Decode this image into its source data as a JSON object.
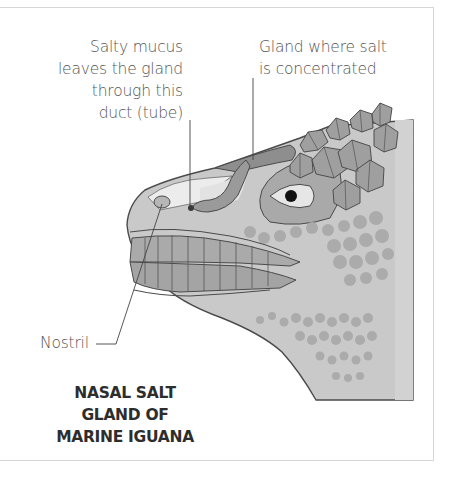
{
  "diagram": {
    "title_lines": [
      "NASAL SALT",
      "GLAND OF",
      "MARINE IGUANA"
    ],
    "labels": {
      "duct": {
        "lines": [
          "Salty mucus",
          "leaves the gland",
          "through this",
          "duct (tube)"
        ]
      },
      "gland": {
        "lines": [
          "Gland where salt",
          "is concentrated"
        ]
      },
      "nostril": {
        "text": "Nostril"
      }
    },
    "colors": {
      "skin": "#c9c9c9",
      "scale_patches": "#a8a8a8",
      "outline": "#4a4a4a",
      "gland": "#8e8e8e",
      "duct": "#9a9a9a",
      "nasal_chamber": "#ebebeb",
      "eye_pupil": "#111111",
      "text_label": "#555555",
      "text_title": "#2d2d2d"
    }
  }
}
